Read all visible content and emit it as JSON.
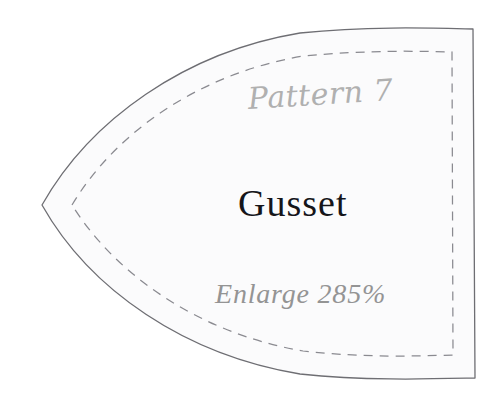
{
  "sheet": {
    "background_color": "#ffffff",
    "piece_fill_color": "#fbfbfc",
    "cut_line_color": "#6e6e73",
    "stitch_line_color": "#8a8a90"
  },
  "pattern_piece": {
    "name": "Gusset",
    "pattern_number_label": "Pattern 7",
    "enlarge_label": "Enlarge 285%",
    "enlarge_percent": 285,
    "pattern_number": 7,
    "cut_line_name": "cutting-line",
    "stitch_line_name": "seam-allowance-dashed-line"
  }
}
